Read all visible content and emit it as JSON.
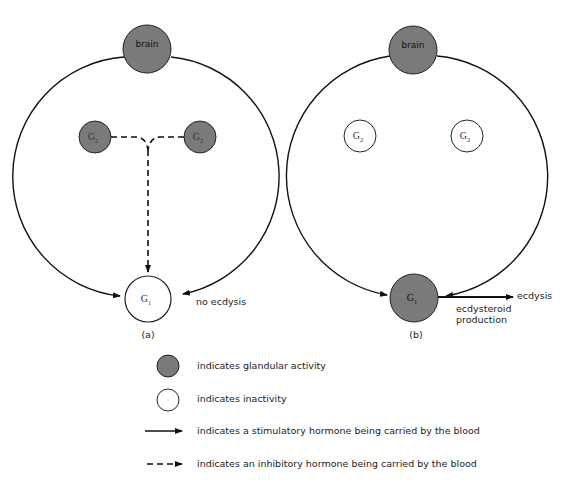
{
  "colors": {
    "active_fill": "#7a7a7a",
    "inactive_fill": "#ffffff",
    "stroke": "#111111"
  },
  "panel_a": {
    "label": "(a)",
    "brain": {
      "label": "brain",
      "state": "active"
    },
    "g2_left": {
      "label": "G",
      "sub": "2",
      "state": "active"
    },
    "g2_right": {
      "label": "G",
      "sub": "2",
      "state": "active"
    },
    "g1": {
      "label": "G",
      "sub": "1",
      "state": "inactive"
    },
    "outcome": "no ecdysis"
  },
  "panel_b": {
    "label": "(b)",
    "brain": {
      "label": "brain",
      "state": "active"
    },
    "g2_left": {
      "label": "G",
      "sub": "2",
      "state": "inactive"
    },
    "g2_right": {
      "label": "G",
      "sub": "2",
      "state": "inactive"
    },
    "g1": {
      "label": "G",
      "sub": "1",
      "state": "active"
    },
    "output_arrow_label": "ecdysis",
    "output_caption_line1": "ecdysteroid",
    "output_caption_line2": "production"
  },
  "legend": [
    {
      "symbol": "filled-circle",
      "text": "indicates glandular activity"
    },
    {
      "symbol": "open-circle",
      "text": "indicates inactivity"
    },
    {
      "symbol": "solid-arrow",
      "text": "indicates a stimulatory hormone being carried by the blood"
    },
    {
      "symbol": "dashed-arrow",
      "text": "indicates an inhibitory hormone being carried by the blood"
    }
  ]
}
